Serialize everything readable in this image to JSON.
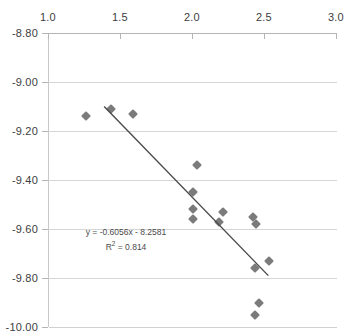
{
  "chart_data": {
    "type": "scatter",
    "title": "",
    "xlabel": "",
    "ylabel": "",
    "xlim": [
      1.0,
      3.0
    ],
    "ylim": [
      -10.0,
      -8.8
    ],
    "xticks": [
      "1.0",
      "1.5",
      "2.0",
      "2.5",
      "3.0"
    ],
    "xtick_values": [
      1.0,
      1.5,
      2.0,
      2.5,
      3.0
    ],
    "yticks": [
      "-8.80",
      "-9.00",
      "-9.20",
      "-9.40",
      "-9.60",
      "-9.80",
      "-10.00"
    ],
    "ytick_values": [
      -8.8,
      -9.0,
      -9.2,
      -9.4,
      -9.6,
      -9.8,
      -10.0
    ],
    "grid": "horizontal",
    "legend": "none",
    "x_axis_position": "top",
    "marker": "diamond",
    "marker_color": "#7b7b7b",
    "trendline_color": "#4a4a4a",
    "points": [
      {
        "x": 1.26,
        "y": -9.14
      },
      {
        "x": 1.43,
        "y": -9.11
      },
      {
        "x": 1.58,
        "y": -9.13
      },
      {
        "x": 2.03,
        "y": -9.34
      },
      {
        "x": 2.0,
        "y": -9.45
      },
      {
        "x": 2.0,
        "y": -9.52
      },
      {
        "x": 2.0,
        "y": -9.56
      },
      {
        "x": 2.21,
        "y": -9.53
      },
      {
        "x": 2.18,
        "y": -9.57
      },
      {
        "x": 2.42,
        "y": -9.55
      },
      {
        "x": 2.44,
        "y": -9.58
      },
      {
        "x": 2.43,
        "y": -9.76
      },
      {
        "x": 2.53,
        "y": -9.73
      },
      {
        "x": 2.46,
        "y": -9.9
      },
      {
        "x": 2.43,
        "y": -9.95
      }
    ],
    "trendline": {
      "slope": -0.6056,
      "intercept": -8.2581,
      "r_squared": 0.814,
      "x_start": 1.39,
      "x_end": 2.53
    },
    "annotation": {
      "equation": "y = -0.6056x - 8.2581",
      "r2_prefix": "R",
      "r2_exponent": "2",
      "r2_value": " = 0.814"
    }
  }
}
